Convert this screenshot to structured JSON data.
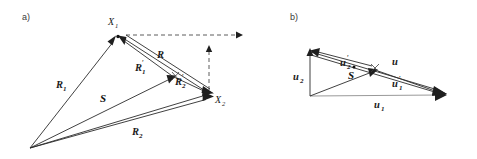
{
  "figure": {
    "background_color": "#ffffff",
    "ink_color": "#1f1f1f",
    "panels": [
      {
        "id": "a",
        "tag": "a)",
        "points": [
          {
            "name": "origin",
            "label": "",
            "x": 30,
            "y": 148
          },
          {
            "name": "X1",
            "label": "X",
            "sub": "1",
            "x": 118,
            "y": 37
          },
          {
            "name": "X2",
            "label": "X",
            "sub": "2",
            "x": 213,
            "y": 93
          }
        ],
        "labels": [
          {
            "name": "R1",
            "text": "R",
            "sub": "1",
            "prime": false,
            "x": 62,
            "y": 85
          },
          {
            "name": "R2",
            "text": "R",
            "sub": "2",
            "prime": false,
            "x": 137,
            "y": 132
          },
          {
            "name": "R",
            "text": "R",
            "sub": "",
            "prime": false,
            "x": 161,
            "y": 55
          },
          {
            "name": "R1-prime",
            "text": "R",
            "sub": "1",
            "prime": true,
            "x": 141,
            "y": 68
          },
          {
            "name": "R2-prime",
            "text": "R",
            "sub": "2",
            "prime": true,
            "x": 181,
            "y": 82
          },
          {
            "name": "S",
            "text": "S",
            "sub": "",
            "prime": false,
            "x": 104,
            "y": 99
          }
        ],
        "dashed_arrows": [
          {
            "name": "horizontal-reference-arrow",
            "x1": 126,
            "y1": 35,
            "x2": 240,
            "y2": 35
          },
          {
            "name": "vertical-reference-arrow",
            "x1": 209,
            "y1": 88,
            "x2": 209,
            "y2": 48
          }
        ]
      },
      {
        "id": "b",
        "tag": "b)",
        "points": [
          {
            "name": "origin",
            "label": "",
            "x": 310,
            "y": 96
          },
          {
            "name": "apex-top",
            "label": "",
            "x": 306,
            "y": 49
          },
          {
            "name": "apex-right",
            "label": "",
            "x": 446,
            "y": 94
          }
        ],
        "labels": [
          {
            "name": "u1",
            "text": "u",
            "sub": "1",
            "prime": false,
            "x": 378,
            "y": 105
          },
          {
            "name": "u2",
            "text": "u",
            "sub": "2",
            "prime": false,
            "x": 299,
            "y": 78
          },
          {
            "name": "u",
            "text": "u",
            "sub": "",
            "prime": false,
            "x": 395,
            "y": 63
          },
          {
            "name": "u1-prime",
            "text": "u",
            "sub": "1",
            "prime": true,
            "x": 398,
            "y": 84
          },
          {
            "name": "u2-prime",
            "text": "u",
            "sub": "2",
            "prime": true,
            "x": 345,
            "y": 63
          },
          {
            "name": "S-dot",
            "text": "S",
            "sub": "",
            "prime": false,
            "x": 352,
            "y": 76
          }
        ]
      }
    ]
  }
}
